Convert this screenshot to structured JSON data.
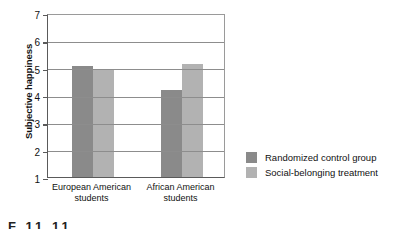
{
  "chart_data": {
    "type": "bar",
    "title": "",
    "xlabel": "",
    "ylabel": "Subjective happiness",
    "ylim": [
      1,
      7
    ],
    "yticks": [
      1,
      2,
      3,
      4,
      5,
      6,
      7
    ],
    "ytick_labels": [
      "1",
      "2",
      "3",
      "4",
      "5",
      "6",
      "7"
    ],
    "grid": true,
    "legend_position": "right",
    "categories": [
      "European American students",
      "African American students"
    ],
    "category_lines": [
      [
        "European American",
        "students"
      ],
      [
        "African American",
        "students"
      ]
    ],
    "series": [
      {
        "name": "Randomized control group",
        "color": "#8a8a8a",
        "values": [
          5.05,
          4.2
        ]
      },
      {
        "name": "Social-belonging treatment",
        "color": "#b2b2b2",
        "values": [
          4.95,
          5.15
        ]
      }
    ]
  },
  "axis": {
    "y_title": "Subjective happiness"
  },
  "legend": {
    "items": [
      {
        "label": "Randomized control group",
        "color": "#8a8a8a"
      },
      {
        "label": "Social-belonging treatment",
        "color": "#b2b2b2"
      }
    ]
  },
  "caption": {
    "partial_text": "F         11  11"
  }
}
